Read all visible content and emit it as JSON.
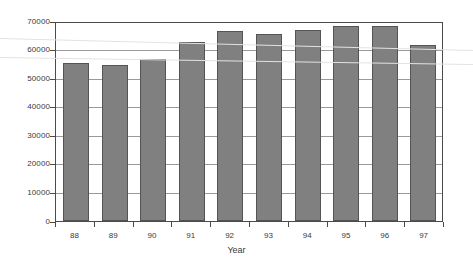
{
  "chart_data": {
    "type": "bar",
    "title": "",
    "subtitle": "",
    "xlabel": "Year",
    "ylabel": "",
    "categories": [
      "88",
      "89",
      "90",
      "91",
      "92",
      "93",
      "94",
      "95",
      "96",
      "97"
    ],
    "values": [
      56000,
      55000,
      57300,
      63300,
      67100,
      66100,
      67500,
      68900,
      68800,
      62200
    ],
    "series": [
      {
        "name": "",
        "values": [
          56000,
          55000,
          57300,
          63300,
          67100,
          66100,
          67500,
          68900,
          68800,
          62200
        ]
      }
    ],
    "ylim": [
      0,
      70000
    ],
    "ytick_labels": [
      "0",
      "10000",
      "20000",
      "30000",
      "40000",
      "50000",
      "60000",
      "70000"
    ],
    "ytick_values": [
      0,
      10000,
      20000,
      30000,
      40000,
      50000,
      60000,
      70000
    ],
    "xtick_labels": [
      "88",
      "89",
      "90",
      "91",
      "92",
      "93",
      "94",
      "95",
      "96",
      "97"
    ],
    "grid": true,
    "grid_axis": "y",
    "legend": false,
    "legend_position": "none",
    "bar_color": "#808080",
    "bar_border_color": "#545454",
    "gridline_color": "#9a9a9a",
    "frame_color": "#4b4b4b",
    "background_color": "#ffffff",
    "text_color": "#3a3a3a",
    "annotations": []
  }
}
